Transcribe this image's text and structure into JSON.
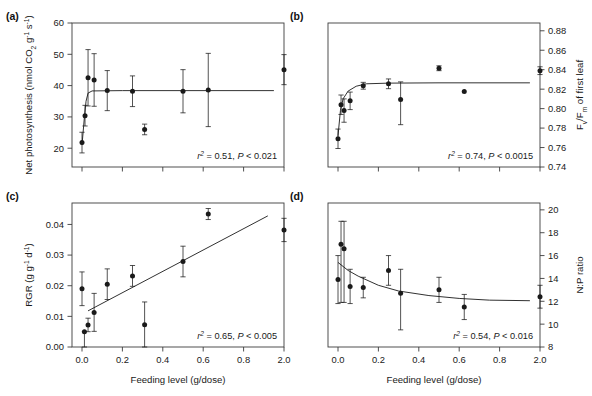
{
  "figure": {
    "width": 579,
    "height": 396,
    "background": "#ffffff",
    "ink_color": "#1a1a1a",
    "axis_color": "#3c3c3c"
  },
  "shared": {
    "xlabel": "Feeding level (g/dose)",
    "x_tick_labels": [
      "0.0",
      "0.2",
      "0.4",
      "0.6",
      "0.8",
      "2.0"
    ],
    "x_tick_values": [
      0.0,
      0.2,
      0.4,
      0.6,
      0.8,
      2.0
    ],
    "x_axis_note": "broken axis: last category 2.0 plotted one tick beyond 0.8"
  },
  "panels": [
    {
      "key": "a",
      "label": "(a)",
      "ylabel_parts": [
        "Net photosynthesis (nmol CO",
        "2",
        " g",
        "-1",
        " s",
        "-1",
        ")"
      ],
      "ylabel_plain": "Net photosynthesis (nmol CO2 g-1 s-1)",
      "y_side": "left",
      "y_tick_labels": [
        "20",
        "30",
        "40",
        "50",
        "60"
      ],
      "stat_r2": "0.51",
      "stat_p": "P < 0.021",
      "stat_full": "r2 = 0.51,  P < 0.021",
      "show_x_tick_labels": false
    },
    {
      "key": "b",
      "label": "(b)",
      "ylabel_parts": [
        "F",
        "v",
        "/F",
        "m",
        " of first leaf"
      ],
      "ylabel_plain": "Fv/Fm of first leaf",
      "y_side": "right",
      "y_tick_labels": [
        "0.74",
        "0.76",
        "0.78",
        "0.80",
        "0.82",
        "0.84",
        "0.86",
        "0.88"
      ],
      "stat_r2": "0.74",
      "stat_p": "P < 0.0015",
      "stat_full": "r2 = 0.74,  P < 0.0015",
      "show_x_tick_labels": false
    },
    {
      "key": "c",
      "label": "(c)",
      "ylabel_parts": [
        "RGR (g g",
        "-1",
        " d",
        "-1",
        ")"
      ],
      "ylabel_plain": "RGR (g g-1 d-1)",
      "y_side": "left",
      "y_tick_labels": [
        "0.00",
        "0.01",
        "0.02",
        "0.03",
        "0.04"
      ],
      "stat_r2": "0.65",
      "stat_p": "P < 0.005",
      "stat_full": "r2 = 0.65,  P < 0.005",
      "show_x_tick_labels": true
    },
    {
      "key": "d",
      "label": "(d)",
      "ylabel_parts": [
        "N:P ratio"
      ],
      "ylabel_plain": "N:P ratio",
      "y_side": "right",
      "y_tick_labels": [
        "8",
        "10",
        "12",
        "14",
        "16",
        "18",
        "20"
      ],
      "stat_r2": "0.54",
      "stat_p": "P < 0.016",
      "stat_full": "r2 = 0.54,  P < 0.016",
      "show_x_tick_labels": true
    }
  ],
  "chart_data": [
    {
      "type": "scatter",
      "panel": "a",
      "title": "(a)",
      "xlabel": "Feeding level (g/dose)",
      "ylabel": "Net photosynthesis (nmol CO2 g-1 s-1)",
      "xlim": [
        -0.03,
        0.95
      ],
      "ylim": [
        14,
        60
      ],
      "xticks": [
        0.0,
        0.2,
        0.4,
        0.6,
        0.8,
        2.0
      ],
      "yticks": [
        20,
        30,
        40,
        50,
        60
      ],
      "grid": false,
      "legend": "none",
      "annotation": "r2 = 0.51,  P < 0.021",
      "x": [
        0.0,
        0.015,
        0.03,
        0.06,
        0.125,
        0.25,
        0.31,
        0.5,
        0.625,
        2.0
      ],
      "y": [
        21.8,
        30.4,
        42.5,
        41.8,
        38.4,
        38.2,
        26.0,
        38.2,
        38.6,
        45.1
      ],
      "yerr_low": [
        3.3,
        3.3,
        9.0,
        8.4,
        6.4,
        4.9,
        1.7,
        6.9,
        11.7,
        4.8
      ],
      "yerr_high": [
        3.3,
        3.3,
        9.0,
        8.4,
        6.4,
        4.9,
        1.7,
        6.9,
        11.7,
        4.8
      ],
      "fit": {
        "kind": "saturating",
        "points_x": [
          0.0,
          0.012,
          0.02,
          0.03,
          0.05,
          0.2,
          0.5,
          0.95
        ],
        "points_y": [
          21.0,
          30.0,
          35.0,
          37.6,
          38.3,
          38.4,
          38.4,
          38.4
        ]
      }
    },
    {
      "type": "scatter",
      "panel": "b",
      "title": "(b)",
      "xlabel": "Feeding level (g/dose)",
      "ylabel": "Fv/Fm of first leaf",
      "xlim": [
        -0.03,
        0.95
      ],
      "ylim": [
        0.74,
        0.888
      ],
      "xticks": [
        0.0,
        0.2,
        0.4,
        0.6,
        0.8,
        2.0
      ],
      "yticks": [
        0.74,
        0.76,
        0.78,
        0.8,
        0.82,
        0.84,
        0.86,
        0.88
      ],
      "grid": false,
      "legend": "none",
      "annotation": "r2 = 0.74,  P < 0.0015",
      "x": [
        0.0,
        0.015,
        0.03,
        0.06,
        0.125,
        0.25,
        0.31,
        0.5,
        0.625,
        2.0
      ],
      "y": [
        0.769,
        0.804,
        0.798,
        0.808,
        0.8235,
        0.8255,
        0.8095,
        0.8415,
        0.8175,
        0.839
      ],
      "yerr_low": [
        0.01,
        0.01,
        0.012,
        0.009,
        0.0035,
        0.005,
        0.026,
        0.0025,
        0.0,
        0.004
      ],
      "yerr_high": [
        0.01,
        0.01,
        0.012,
        0.009,
        0.0035,
        0.005,
        0.018,
        0.0025,
        0.0,
        0.004
      ],
      "fit": {
        "kind": "saturating",
        "points_x": [
          0.0,
          0.012,
          0.025,
          0.05,
          0.09,
          0.14,
          0.25,
          0.5,
          0.95
        ],
        "points_y": [
          0.772,
          0.798,
          0.81,
          0.818,
          0.823,
          0.8255,
          0.8262,
          0.8265,
          0.8265
        ]
      }
    },
    {
      "type": "scatter",
      "panel": "c",
      "title": "(c)",
      "xlabel": "Feeding level (g/dose)",
      "ylabel": "RGR (g g-1 d-1)",
      "xlim": [
        -0.03,
        0.95
      ],
      "ylim": [
        0.0,
        0.047
      ],
      "xticks": [
        0.0,
        0.2,
        0.4,
        0.6,
        0.8,
        2.0
      ],
      "yticks": [
        0.0,
        0.01,
        0.02,
        0.03,
        0.04
      ],
      "grid": false,
      "legend": "none",
      "annotation": "r2 = 0.65,  P < 0.005",
      "x": [
        0.0,
        0.012,
        0.03,
        0.06,
        0.125,
        0.25,
        0.31,
        0.5,
        0.625,
        2.0
      ],
      "y": [
        0.019,
        0.005,
        0.0072,
        0.0113,
        0.0205,
        0.0232,
        0.0073,
        0.0279,
        0.0434,
        0.0382
      ],
      "yerr_low": [
        0.0055,
        0.005,
        0.0022,
        0.0062,
        0.005,
        0.0034,
        0.0073,
        0.005,
        0.0018,
        0.0038
      ],
      "yerr_high": [
        0.0055,
        0.0,
        0.0022,
        0.0062,
        0.005,
        0.0034,
        0.0074,
        0.005,
        0.0018,
        0.0038
      ],
      "fit": {
        "kind": "linear",
        "points_x": [
          0.03,
          0.92
        ],
        "points_y": [
          0.0118,
          0.0428
        ]
      }
    },
    {
      "type": "scatter",
      "panel": "d",
      "title": "(d)",
      "xlabel": "Feeding level (g/dose)",
      "ylabel": "N:P ratio",
      "xlim": [
        -0.03,
        0.95
      ],
      "ylim": [
        8,
        20.6
      ],
      "xticks": [
        0.0,
        0.2,
        0.4,
        0.6,
        0.8,
        2.0
      ],
      "yticks": [
        8,
        10,
        12,
        14,
        16,
        18,
        20
      ],
      "grid": false,
      "legend": "none",
      "annotation": "r2 = 0.54,  P < 0.016",
      "x": [
        0.0,
        0.015,
        0.03,
        0.06,
        0.125,
        0.25,
        0.31,
        0.5,
        0.625,
        2.0
      ],
      "y": [
        13.9,
        17.0,
        16.6,
        13.3,
        13.2,
        14.7,
        12.7,
        13.0,
        11.5,
        12.4
      ],
      "yerr_low": [
        2.1,
        5.1,
        4.7,
        1.5,
        0.9,
        1.3,
        3.2,
        1.1,
        1.1,
        1.0
      ],
      "yerr_high": [
        2.1,
        2.0,
        2.4,
        1.5,
        0.9,
        1.3,
        2.1,
        1.1,
        1.1,
        1.0
      ],
      "fit": {
        "kind": "decay",
        "points_x": [
          0.0,
          0.05,
          0.1,
          0.2,
          0.3,
          0.45,
          0.6,
          0.75,
          0.95
        ],
        "points_y": [
          15.4,
          14.7,
          14.2,
          13.4,
          12.9,
          12.5,
          12.25,
          12.1,
          12.05
        ]
      }
    }
  ]
}
